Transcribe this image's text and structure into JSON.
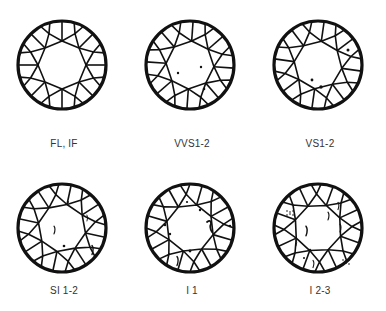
{
  "grades": [
    {
      "label": "FL, IF",
      "inclusions": []
    },
    {
      "label": "VVS1-2",
      "inclusions": [
        [
          -12,
          8,
          1.2
        ],
        [
          11,
          2,
          1.2
        ],
        [
          14,
          24,
          1.3
        ]
      ]
    },
    {
      "label": "VS1-2",
      "inclusions": [
        [
          -6,
          15,
          1.4
        ],
        [
          3,
          22,
          1.7
        ],
        [
          30,
          -15,
          1.5
        ]
      ]
    },
    {
      "label": "SI 1-2",
      "inclusions": [
        [
          -8,
          2,
          1.3,
          "streak"
        ],
        [
          6,
          -26,
          1
        ],
        [
          25,
          -10,
          1,
          "streak"
        ],
        [
          2,
          18,
          1.3
        ],
        [
          30,
          22,
          1.5,
          "streak"
        ]
      ]
    },
    {
      "label": "I 1",
      "inclusions": [
        [
          10,
          -18,
          1.2
        ],
        [
          -25,
          -3,
          1.2
        ],
        [
          -20,
          6,
          1.2
        ],
        [
          20,
          -3,
          2,
          "hook"
        ],
        [
          0,
          23,
          1.4
        ],
        [
          -13,
          33,
          1.5,
          "streak"
        ],
        [
          40,
          -2,
          1.2
        ],
        [
          -3,
          -26,
          1.1
        ]
      ]
    },
    {
      "label": "I 2-3",
      "inclusions": [
        [
          -28,
          -17,
          1,
          "cluster"
        ],
        [
          -12,
          3,
          1.6,
          "crack"
        ],
        [
          10,
          -12,
          1.3,
          "streak"
        ],
        [
          22,
          0,
          1.3,
          "streak"
        ],
        [
          -22,
          15,
          1,
          "streak"
        ],
        [
          28,
          32,
          1,
          "cluster"
        ],
        [
          -5,
          36,
          1.2,
          "streak"
        ],
        [
          20,
          -22,
          1.2,
          "streak"
        ],
        [
          -8,
          22,
          1.2
        ],
        [
          -14,
          30,
          1
        ]
      ]
    }
  ]
}
